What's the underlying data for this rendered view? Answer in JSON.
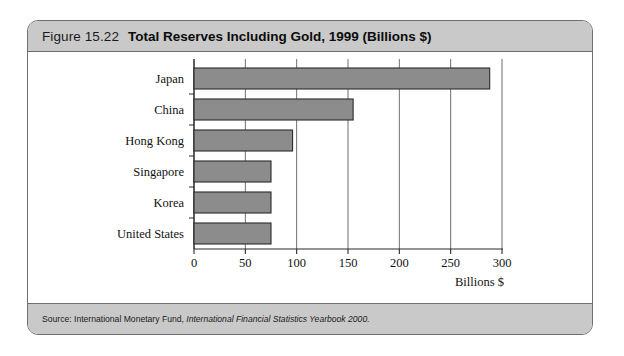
{
  "figure": {
    "number": "Figure 15.22",
    "title": "Total Reserves Including Gold, 1999 (Billions $)",
    "source_prefix": "Source: International Monetary Fund, ",
    "source_italic": "International Financial Statistics Yearbook 2000."
  },
  "colors": {
    "bar_fill": "#8c8c8c",
    "bar_stroke": "#2b2b2b",
    "band": "#c9c9c9",
    "frame": "#6f6f6f",
    "grid": "#6f6f6f"
  },
  "chart_data": {
    "type": "bar",
    "orientation": "horizontal",
    "title": "Total Reserves Including Gold, 1999 (Billions $)",
    "categories": [
      "Japan",
      "China",
      "Hong Kong",
      "Singapore",
      "Korea",
      "United States"
    ],
    "values": [
      288,
      155,
      96,
      75,
      75,
      75
    ],
    "xlabel": "Billions $",
    "ylabel": "",
    "xlim": [
      0,
      300
    ],
    "xticks": [
      0,
      50,
      100,
      150,
      200,
      250,
      300
    ],
    "xtick_labels": [
      "0",
      "50",
      "100",
      "150",
      "200",
      "250",
      "300"
    ],
    "grid": true,
    "grid_axis": "x",
    "legend": false
  }
}
